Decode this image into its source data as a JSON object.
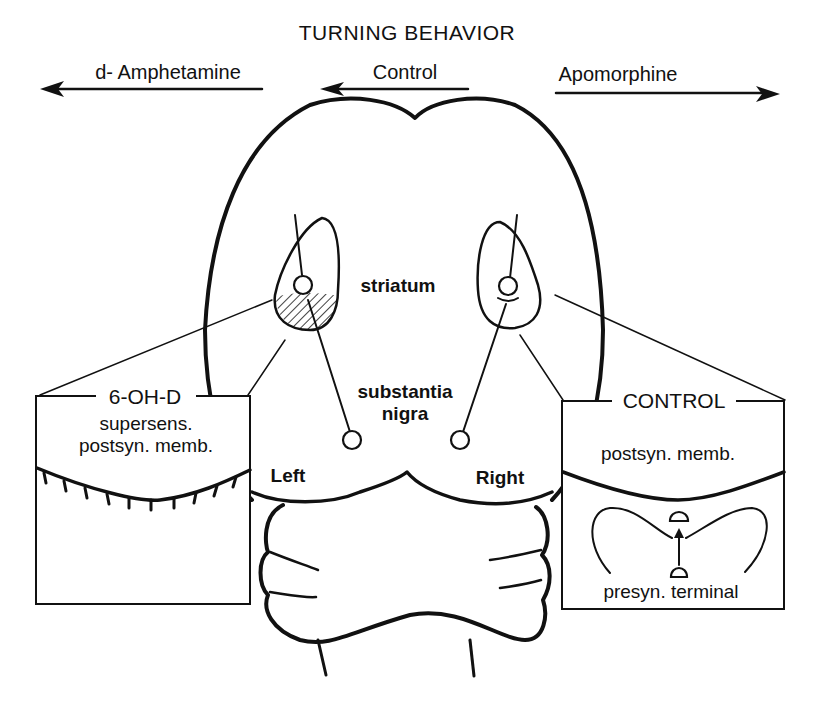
{
  "figure": {
    "title": "TURNING BEHAVIOR",
    "arrows": [
      {
        "label": "d- Amphetamine",
        "direction": "left"
      },
      {
        "label": "Control",
        "direction": "left"
      },
      {
        "label": "Apomorphine",
        "direction": "right"
      }
    ],
    "regions": {
      "striatum": "striatum",
      "substantia_nigra_line1": "substantia",
      "substantia_nigra_line2": "nigra",
      "left": "Left",
      "right": "Right"
    },
    "left_inset": {
      "heading": "6-OH-D",
      "line1": "supersens.",
      "line2": "postsyn. memb."
    },
    "right_inset": {
      "heading": "CONTROL",
      "line1": "postsyn. memb.",
      "line2": "presyn. terminal"
    },
    "colors": {
      "ink": "#111111",
      "background": "#ffffff"
    }
  }
}
